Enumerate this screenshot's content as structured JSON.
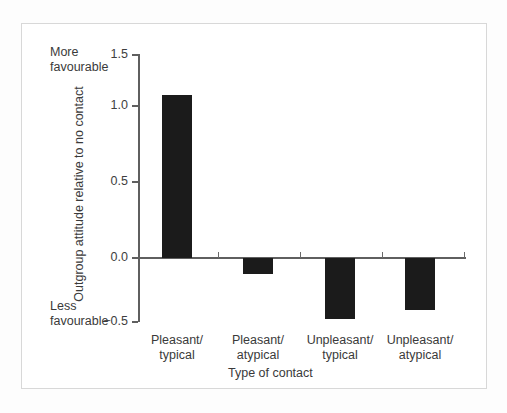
{
  "figure": {
    "background_color": "#ffffff",
    "frame_color": "#d8d8d8",
    "bar_color": "#1b1b1b",
    "axis_color": "#5f5f5f"
  },
  "annotations": {
    "more_favourable_line1": "More",
    "more_favourable_line2": "favourable",
    "less_favourable_line1": "Less",
    "less_favourable_line2": "favourable"
  },
  "axes": {
    "y_title": "Outgroup attitude relative to no contact",
    "x_title": "Type of contact",
    "y_ticks": [
      "1.5",
      "1.0",
      "0.5",
      "0.0",
      "−0.5"
    ]
  },
  "categories_display": [
    {
      "line1": "Pleasant/",
      "line2": "typical"
    },
    {
      "line1": "Pleasant/",
      "line2": "atypical"
    },
    {
      "line1": "Unpleasant/",
      "line2": "typical"
    },
    {
      "line1": "Unpleasant/",
      "line2": "atypical"
    }
  ],
  "chart_data": {
    "type": "bar",
    "title": "",
    "subtitle": "",
    "categories": [
      "Pleasant/typical",
      "Pleasant/atypical",
      "Unpleasant/typical",
      "Unpleasant/atypical"
    ],
    "values": [
      1.2,
      -0.12,
      -0.45,
      -0.38
    ],
    "xlabel": "Type of contact",
    "ylabel": "Outgroup attitude relative to no contact",
    "ylim": [
      -0.5,
      1.5
    ],
    "yticks": [
      -0.5,
      0.0,
      0.5,
      1.0,
      1.5
    ],
    "ytick_labels": [
      "−0.5",
      "0.0",
      "0.5",
      "1.0",
      "1.5"
    ],
    "grid": false,
    "legend": false,
    "legend_position": "none",
    "annotations": [
      {
        "text": "More favourable",
        "position": "top-left-of-yaxis"
      },
      {
        "text": "Less favourable",
        "position": "bottom-left-of-yaxis"
      }
    ],
    "series": [
      {
        "name": "Outgroup attitude relative to no contact",
        "values": [
          1.2,
          -0.12,
          -0.45,
          -0.38
        ],
        "color": "#1b1b1b"
      }
    ]
  }
}
